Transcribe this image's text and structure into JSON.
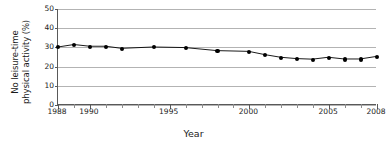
{
  "chart_data": {
    "type": "line",
    "title": "",
    "subtitle": "",
    "xlabel": "Year",
    "ylabel": "No leisure-time physical activity (%)",
    "ylabel_line1": "No leisure-time",
    "ylabel_line2": "physical activity (%)",
    "xlim": [
      1988,
      2008
    ],
    "ylim": [
      0,
      50
    ],
    "yticks": [
      50,
      40,
      30,
      20,
      10,
      0
    ],
    "xticks_labeled": [
      1988,
      1990,
      1995,
      2000,
      2005,
      2008
    ],
    "xticks_all": [
      1988,
      1989,
      1990,
      1991,
      1992,
      1993,
      1994,
      1995,
      1996,
      1997,
      1998,
      1999,
      2000,
      2001,
      2002,
      2003,
      2004,
      2005,
      2006,
      2007,
      2008
    ],
    "grid": "horizontal",
    "legend": "none",
    "marker": "filled-circle",
    "line_color": "#000000",
    "marker_color": "#000000",
    "grid_color": "#b3b3b3",
    "axis_color": "#595959",
    "x": [
      1988,
      1989,
      1990,
      1991,
      1992,
      1994,
      1996,
      1998,
      2000,
      2001,
      2002,
      2003,
      2004,
      2005,
      2006,
      2007,
      2008
    ],
    "values": [
      30.0,
      31.3,
      30.4,
      30.4,
      29.3,
      30.0,
      29.7,
      28.1,
      27.7,
      26.0,
      24.6,
      23.9,
      23.6,
      24.6,
      23.7,
      23.7,
      25.0
    ],
    "series": [
      {
        "name": "No leisure-time physical activity (%)",
        "x": [
          1988,
          1989,
          1990,
          1991,
          1992,
          1994,
          1996,
          1998,
          2000,
          2001,
          2002,
          2003,
          2004,
          2005,
          2006,
          2007,
          2008
        ],
        "values": [
          30.0,
          31.3,
          30.4,
          30.4,
          29.3,
          30.0,
          29.7,
          28.1,
          27.7,
          26.0,
          24.6,
          23.9,
          23.6,
          24.6,
          23.7,
          23.7,
          25.0
        ]
      }
    ]
  }
}
